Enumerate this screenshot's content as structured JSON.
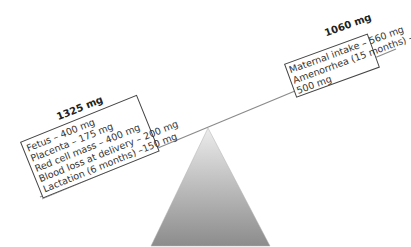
{
  "diagram": {
    "type": "balance-seesaw",
    "left": {
      "total": "1325 mg",
      "items": [
        "Fetus – 400 mg",
        "Placenta – 175 mg",
        "Red cell mass – 400 mg",
        "Blood loss at delivery – 200 mg",
        "Lactation (6 months) –150 mg"
      ]
    },
    "right": {
      "total": "1060 mg",
      "items": [
        "Maternal intake – 560 mg",
        "Amenorrhea (15 months) –",
        "500 mg"
      ]
    },
    "colors": {
      "beam": "#8a8a8a",
      "fulcrum_top": "#e6e6e6",
      "fulcrum_bottom": "#8c8c8c",
      "box_border": "#444444"
    }
  }
}
